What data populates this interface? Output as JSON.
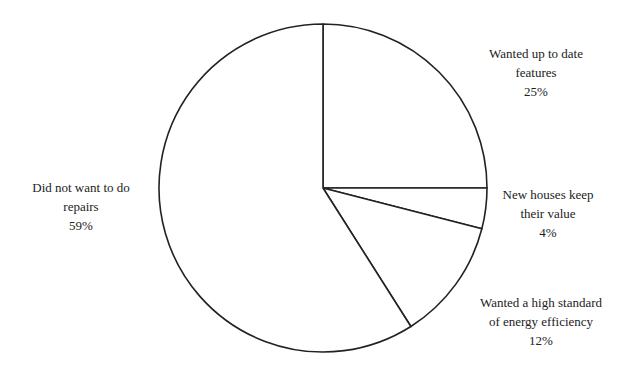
{
  "chart_data": {
    "type": "pie",
    "title": "",
    "start_angle": "12 o'clock",
    "direction": "clockwise",
    "fill": "#ffffff",
    "stroke": "#222222",
    "slices": [
      {
        "label": "Wanted up to date features",
        "value": 25,
        "value_label": "25%"
      },
      {
        "label": "New houses keep their value",
        "value": 4,
        "value_label": "4%"
      },
      {
        "label": "Wanted a high standard of energy efficiency",
        "value": 12,
        "value_label": "12%"
      },
      {
        "label": "Did not want to do repairs",
        "value": 59,
        "value_label": "59%"
      }
    ]
  },
  "labels": {
    "features": {
      "line1": "Wanted up to date",
      "line2": "features",
      "pct": "25%"
    },
    "value": {
      "line1": "New houses keep",
      "line2": "their value",
      "pct": "4%"
    },
    "energy": {
      "line1": "Wanted a high standard",
      "line2": "of energy efficiency",
      "pct": "12%"
    },
    "repairs": {
      "line1": "Did not want to do",
      "line2": "repairs",
      "pct": "59%"
    }
  }
}
